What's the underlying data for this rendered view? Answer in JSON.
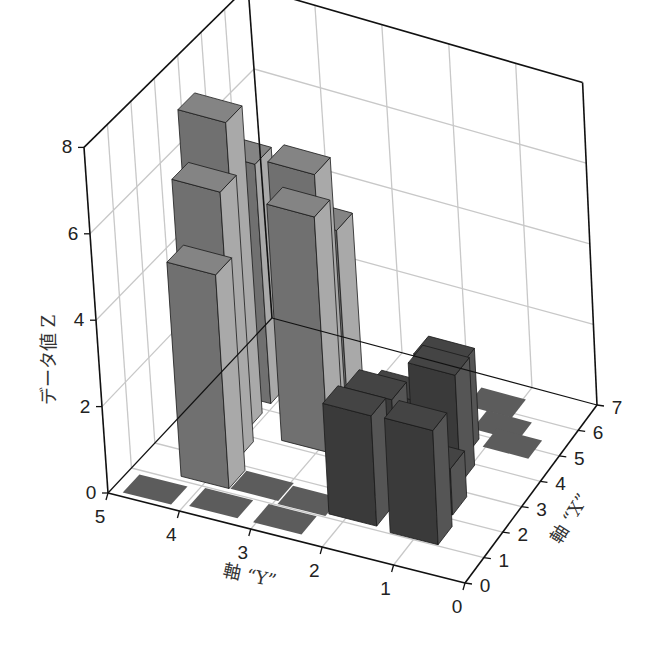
{
  "chart_data": {
    "type": "bar3d",
    "title": "",
    "zlabel": "データ値 Z",
    "ylabel": "軸 “Y”",
    "xlabel": "軸 “X”",
    "x_axis": {
      "range": [
        0,
        7
      ],
      "ticks": [
        0,
        1,
        2,
        3,
        4,
        5,
        6,
        7
      ]
    },
    "y_axis": {
      "range": [
        0,
        5
      ],
      "ticks": [
        0,
        1,
        2,
        3,
        4,
        5
      ]
    },
    "z_axis": {
      "range": [
        0,
        8
      ],
      "ticks": [
        0,
        2,
        4,
        6,
        8
      ]
    },
    "grid": true,
    "series": [
      {
        "name": "light",
        "color": "#8f8f8f",
        "bars": [
          {
            "x": 1.5,
            "y": 4.0,
            "z": 5.0
          },
          {
            "x": 2.5,
            "y": 4.2,
            "z": 6.3
          },
          {
            "x": 3.5,
            "y": 4.4,
            "z": 7.3
          },
          {
            "x": 4.6,
            "y": 4.4,
            "z": 5.7
          },
          {
            "x": 3.5,
            "y": 3.2,
            "z": 5.6
          },
          {
            "x": 4.8,
            "y": 3.6,
            "z": 5.7
          },
          {
            "x": 5.6,
            "y": 3.6,
            "z": 3.9
          }
        ]
      },
      {
        "name": "dark",
        "color": "#4a4a4a",
        "bars": [
          {
            "x": 1.5,
            "y": 1.9,
            "z": 2.6
          },
          {
            "x": 2.5,
            "y": 1.9,
            "z": 2.4
          },
          {
            "x": 3.5,
            "y": 1.9,
            "z": 1.8
          },
          {
            "x": 4.4,
            "y": 1.9,
            "z": 0.8
          },
          {
            "x": 1.4,
            "y": 1.0,
            "z": 2.7
          },
          {
            "x": 2.5,
            "y": 1.1,
            "z": 1.1
          },
          {
            "x": 3.6,
            "y": 1.3,
            "z": 2.6
          },
          {
            "x": 4.5,
            "y": 1.5,
            "z": 2.2
          }
        ]
      },
      {
        "name": "flat",
        "color": "#5c5c5c",
        "bars": [
          {
            "x": 0.5,
            "y": 4.5,
            "z": 0.0
          },
          {
            "x": 0.6,
            "y": 3.6,
            "z": 0.0
          },
          {
            "x": 1.5,
            "y": 3.3,
            "z": 0.0
          },
          {
            "x": 0.6,
            "y": 2.7,
            "z": 0.0
          },
          {
            "x": 1.4,
            "y": 2.6,
            "z": 0.0
          },
          {
            "x": 5.4,
            "y": 2.2,
            "z": 0.0
          },
          {
            "x": 6.2,
            "y": 1.3,
            "z": 0.0
          },
          {
            "x": 5.5,
            "y": 1.0,
            "z": 0.0
          },
          {
            "x": 5.0,
            "y": 0.7,
            "z": 0.0
          }
        ]
      }
    ]
  },
  "labels": {
    "z_title": "データ値 Z",
    "y_title": "軸 “Y”",
    "x_title": "軸 “X”"
  }
}
